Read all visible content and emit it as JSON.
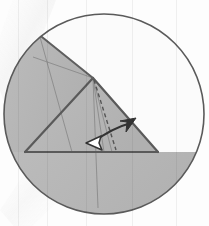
{
  "figure": {
    "title": "Origami fold step diagram",
    "type": "geometric-fold-diagram",
    "canvas": {
      "width": 209,
      "height": 226
    },
    "background_color": "#fdfdfd"
  },
  "colors": {
    "paper_fill": "#b5b5b5",
    "paper_fill_light": "#c0c0c0",
    "paper_fill_dark": "#aaaaaa",
    "white_fill": "#fbfbfb",
    "outline_stroke": "#5a5a5a",
    "fold_line_stroke": "#6e6e6e",
    "thin_line_stroke": "#8a8a8a",
    "dashed_line_stroke": "#555555",
    "arrow_dark": "#333333",
    "arrow_white_fill": "#ffffff",
    "glare_color": "#eeeeee"
  },
  "circle": {
    "label": "outer-circle",
    "center_x": 104,
    "center_y": 114,
    "radius": 100,
    "stroke_width": 1.6
  },
  "triangle": {
    "label": "main-triangle",
    "apex": {
      "x": 93,
      "y": 78
    },
    "base_left": {
      "x": 25,
      "y": 152
    },
    "base_right": {
      "x": 158,
      "y": 152
    },
    "stroke_width": 2.2
  },
  "regions": [
    {
      "name": "upper-left-wedge",
      "description": "Shaded flap from apex up-left to circle arc",
      "fill": "#b5b5b5"
    },
    {
      "name": "triangle-body",
      "description": "Main shaded triangle body",
      "fill": "#b5b5b5"
    },
    {
      "name": "lower-segment",
      "description": "Shaded circular segment below the triangle base",
      "fill": "#b5b5b5"
    },
    {
      "name": "right-white-region",
      "description": "Unshaded region right of the right fold edge",
      "fill": "#fbfbfb"
    }
  ],
  "fold_lines": [
    {
      "name": "fold-apex-to-lower-left",
      "from": {
        "x": 93,
        "y": 78
      },
      "to": {
        "x": 25,
        "y": 152
      }
    },
    {
      "name": "crease-apex-to-left-arc",
      "from": {
        "x": 93,
        "y": 78
      },
      "to": {
        "x": 33,
        "y": 57
      }
    },
    {
      "name": "crease-left-diagonal",
      "from": {
        "x": 40,
        "y": 37
      },
      "to": {
        "x": 72,
        "y": 152
      }
    },
    {
      "name": "crease-through-base",
      "from": {
        "x": 93,
        "y": 78
      },
      "to": {
        "x": 98,
        "y": 208
      }
    },
    {
      "name": "crease-apex-short-right",
      "from": {
        "x": 93,
        "y": 78
      },
      "to": {
        "x": 112,
        "y": 152
      }
    }
  ],
  "dashed_line": {
    "name": "dashed-fold-guide",
    "from": {
      "x": 94,
      "y": 80
    },
    "to": {
      "x": 116,
      "y": 150
    },
    "dash_pattern": "4,3",
    "stroke_width": 1.4
  },
  "motion_arrow": {
    "name": "double-headed-fold-arrow",
    "style": "curved double-headed",
    "head_left": {
      "type": "hollow-white",
      "x": 92,
      "y": 143,
      "angle_deg": 200
    },
    "head_right": {
      "type": "solid-dark",
      "x": 131,
      "y": 123,
      "angle_deg": -38
    },
    "curve_control": {
      "x": 112,
      "y": 128
    },
    "stroke_width": 2.0
  },
  "glare": {
    "name": "diagonal-light-streak",
    "description": "Pale diagonal band crossing upper-left to lower-left",
    "color": "#eeeeee",
    "opacity": 0.75,
    "angle_deg": 52
  },
  "accessibility": {
    "alt_text": "Circle containing a shaded triangular paper shape with fold creases, a dashed guide line, and a curved double-headed arrow indicating a fold rotation."
  }
}
